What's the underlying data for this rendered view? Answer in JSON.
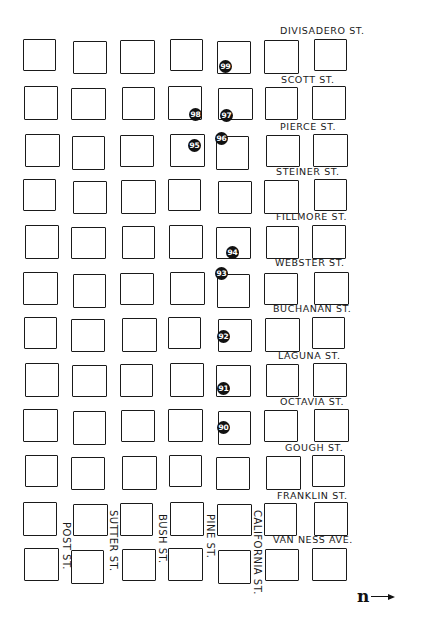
{
  "map": {
    "cols_x": [
      24,
      72,
      121,
      169,
      217,
      265,
      313
    ],
    "rows_y": [
      40,
      87,
      135,
      180,
      226,
      273,
      318,
      364,
      410,
      456,
      503,
      549
    ],
    "block_size": [
      34,
      33
    ],
    "streets_horizontal": [
      {
        "label": "DIVISADERO ST.",
        "x": 280,
        "y": 25
      },
      {
        "label": "SCOTT ST.",
        "x": 281,
        "y": 74
      },
      {
        "label": "PIERCE ST.",
        "x": 280,
        "y": 121
      },
      {
        "label": "STEINER ST.",
        "x": 276,
        "y": 166
      },
      {
        "label": "FILLMORE ST.",
        "x": 276,
        "y": 211
      },
      {
        "label": "WEBSTER ST.",
        "x": 275,
        "y": 257
      },
      {
        "label": "BUCHANAN ST.",
        "x": 273,
        "y": 303
      },
      {
        "label": "LAGUNA ST.",
        "x": 278,
        "y": 350
      },
      {
        "label": "OCTAVIA ST.",
        "x": 280,
        "y": 396
      },
      {
        "label": "GOUGH ST.",
        "x": 285,
        "y": 442
      },
      {
        "label": "FRANKLIN ST.",
        "x": 277,
        "y": 490
      },
      {
        "label": "VAN NESS AVE.",
        "x": 273,
        "y": 534
      }
    ],
    "streets_vertical": [
      {
        "label": "POST ST.",
        "x": 61,
        "y": 522
      },
      {
        "label": "SUTTER ST.",
        "x": 108,
        "y": 510
      },
      {
        "label": "BUSH ST.",
        "x": 157,
        "y": 514
      },
      {
        "label": "PINE ST.",
        "x": 205,
        "y": 514
      },
      {
        "label": "CALIFORNIA ST.",
        "x": 252,
        "y": 510
      }
    ],
    "markers": [
      {
        "label": "99",
        "x": 219,
        "y": 60
      },
      {
        "label": "98",
        "x": 189,
        "y": 108
      },
      {
        "label": "97",
        "x": 220,
        "y": 109
      },
      {
        "label": "96",
        "x": 215,
        "y": 132
      },
      {
        "label": "95",
        "x": 188,
        "y": 139
      },
      {
        "label": "94",
        "x": 226,
        "y": 246
      },
      {
        "label": "93",
        "x": 215,
        "y": 267
      },
      {
        "label": "92",
        "x": 217,
        "y": 330
      },
      {
        "label": "91",
        "x": 217,
        "y": 382
      },
      {
        "label": "90",
        "x": 217,
        "y": 421
      }
    ],
    "north_arrow": {
      "label": "n",
      "direction": "right"
    }
  }
}
